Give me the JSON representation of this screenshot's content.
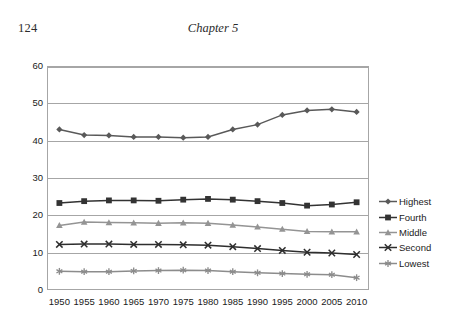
{
  "page": {
    "number": "124",
    "running_head": "Chapter 5"
  },
  "chart_data": {
    "type": "line",
    "title": "",
    "xlabel": "",
    "ylabel": "",
    "categories": [
      "1950",
      "1955",
      "1960",
      "1965",
      "1970",
      "1975",
      "1980",
      "1985",
      "1990",
      "1995",
      "2000",
      "2005",
      "2010"
    ],
    "ylim": [
      0,
      60
    ],
    "yticks": [
      0,
      10,
      20,
      30,
      40,
      50,
      60
    ],
    "ytick_labels": [
      "0",
      "10",
      "20",
      "30",
      "40",
      "50",
      "60"
    ],
    "grid": true,
    "legend_position": "right",
    "series": [
      {
        "name": "Highest",
        "marker": "diamond",
        "color": "#595959",
        "values": [
          43.0,
          41.5,
          41.4,
          41.0,
          41.0,
          40.8,
          41.0,
          43.0,
          44.3,
          46.9,
          48.1,
          48.4,
          47.7
        ]
      },
      {
        "name": "Fourth",
        "marker": "square",
        "color": "#333333",
        "values": [
          23.3,
          23.8,
          24.0,
          24.0,
          23.9,
          24.2,
          24.4,
          24.2,
          23.8,
          23.3,
          22.6,
          22.9,
          23.5
        ]
      },
      {
        "name": "Middle",
        "marker": "triangle",
        "color": "#949494",
        "values": [
          17.3,
          18.2,
          18.1,
          18.0,
          17.9,
          18.0,
          17.9,
          17.4,
          16.9,
          16.3,
          15.7,
          15.6,
          15.6
        ]
      },
      {
        "name": "Second",
        "marker": "cross",
        "color": "#2e2e2e",
        "values": [
          12.2,
          12.3,
          12.3,
          12.2,
          12.2,
          12.1,
          12.0,
          11.6,
          11.1,
          10.6,
          10.1,
          9.9,
          9.5
        ]
      },
      {
        "name": "Lowest",
        "marker": "asterisk",
        "color": "#8c8c8c",
        "values": [
          5.0,
          4.9,
          4.9,
          5.1,
          5.2,
          5.3,
          5.2,
          4.9,
          4.6,
          4.4,
          4.2,
          4.1,
          3.3
        ]
      }
    ]
  }
}
